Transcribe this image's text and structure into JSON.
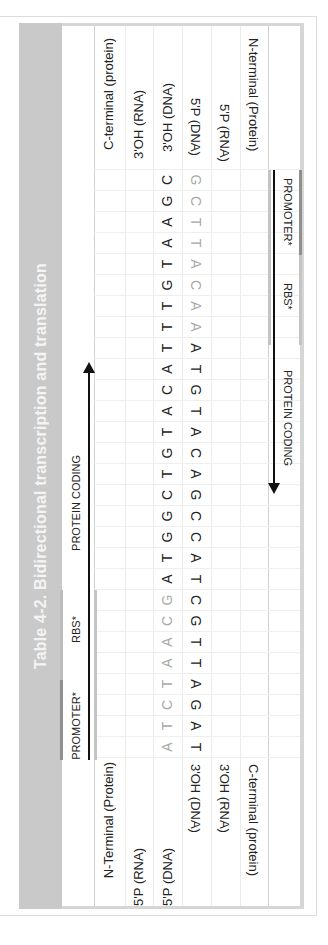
{
  "title": "Table 4-2. Bidirectional transcription and translation",
  "header_left": {
    "promoter": "PROMOTER*",
    "rbs": "RBS*",
    "protein_coding": "PROTEIN CODING"
  },
  "header_right": {
    "promoter": "PROMOTER*",
    "rbs": "RBS*",
    "protein_coding": "PROTEIN CODING"
  },
  "rows": [
    {
      "start_label": "N-Terminal (Protein)",
      "end_label": "C-terminal (protein)"
    },
    {
      "start_label": "5'P (RNA)",
      "end_label": "3'OH (RNA)"
    },
    {
      "start_label": "5'P (DNA)",
      "end_label": "3'OH (DNA)"
    },
    {
      "start_label": "3'OH (DNA)",
      "end_label": "5'P (DNA)"
    },
    {
      "start_label": "3'OH (RNA)",
      "end_label": "5'P (RNA)"
    },
    {
      "start_label": "C-terminal (protein)",
      "end_label": "N-terminal (Protein)"
    }
  ],
  "sequences": {
    "top_strand_5to3": {
      "grey": "ATCTAACG",
      "dark": "ATGGCTGTACATTTGTAAGC"
    },
    "bottom_strand_3to5": {
      "dark": "TAGATTGCTACCGACATGTA",
      "grey": "AACATTCG"
    }
  },
  "colors": {
    "title_bar": "#c9c9c9",
    "title_text": "#f4f4f4",
    "promoter_bar": "#8f8f8f",
    "rbs_bar": "#c4c4c4",
    "grey_base": "#a8a8a8",
    "dark_base": "#222222"
  }
}
